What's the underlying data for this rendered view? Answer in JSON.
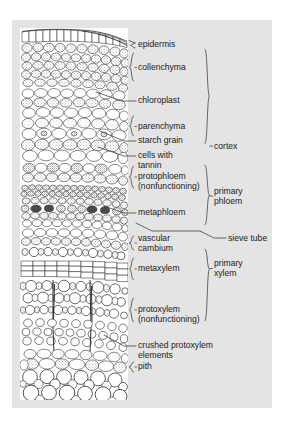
{
  "figure": {
    "type": "labelled-micrograph",
    "panel_background": "#e4e4e4",
    "micrograph_background": "#ffffff",
    "ink_color": "#1b1b1b"
  },
  "labels": [
    {
      "id": "epidermis",
      "text": "epidermis",
      "x": 138,
      "y": 45,
      "leader": "bracket"
    },
    {
      "id": "collenchyma",
      "text": "collenchyma",
      "x": 138,
      "y": 68,
      "leader": "bracket"
    },
    {
      "id": "chloroplast",
      "text": "chloroplast",
      "x": 138,
      "y": 100,
      "leader": "line"
    },
    {
      "id": "parenchyma",
      "text": "parenchyma",
      "x": 138,
      "y": 127,
      "leader": "bracket"
    },
    {
      "id": "starch-grain",
      "text": "starch grain",
      "x": 138,
      "y": 140,
      "leader": "line"
    },
    {
      "id": "cells-with-tannin",
      "text": "cells with\ntannin",
      "x": 138,
      "y": 155,
      "leader": "line"
    },
    {
      "id": "protophloem",
      "text": "protophloem\n(nonfunctioning)",
      "x": 138,
      "y": 180,
      "leader": "bracket"
    },
    {
      "id": "metaphloem",
      "text": "metaphloem",
      "x": 138,
      "y": 211,
      "leader": "line"
    },
    {
      "id": "vascular-cambium",
      "text": "vascular\ncambium",
      "x": 138,
      "y": 238,
      "leader": "bracket"
    },
    {
      "id": "metaxylem",
      "text": "metaxylem",
      "x": 138,
      "y": 276,
      "leader": "bracket"
    },
    {
      "id": "protoxylem",
      "text": "protoxylem\n(nonfunctioning)",
      "x": 138,
      "y": 315,
      "leader": "bracket"
    },
    {
      "id": "crushed-protoxylem",
      "text": "crushed protoxylem\nelements",
      "x": 138,
      "y": 345,
      "leader": "line"
    },
    {
      "id": "pith",
      "text": "pith",
      "x": 138,
      "y": 366,
      "leader": "bracket"
    },
    {
      "id": "sieve-tube",
      "text": "sieve tube",
      "x": 228,
      "y": 238,
      "leader": "line"
    }
  ],
  "groups": [
    {
      "id": "cortex",
      "text": "cortex",
      "x": 214,
      "y": 146
    },
    {
      "id": "primary-phloem",
      "text": "primary\nphloem",
      "x": 214,
      "y": 196
    },
    {
      "id": "primary-xylem",
      "text": "primary\nxylem",
      "x": 214,
      "y": 268
    }
  ]
}
